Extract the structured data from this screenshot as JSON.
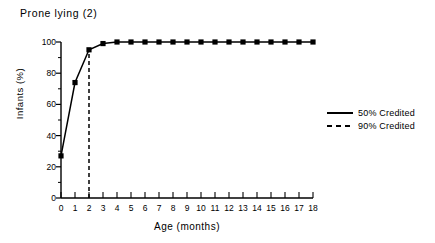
{
  "chart_data": {
    "type": "line",
    "title": "Prone  lying  (2)",
    "xlabel": "Age  (months)",
    "ylabel": "Infants  (%)",
    "xlim": [
      0,
      18
    ],
    "ylim": [
      0,
      100
    ],
    "xticks": [
      0,
      1,
      2,
      3,
      4,
      5,
      6,
      7,
      8,
      9,
      10,
      11,
      12,
      13,
      14,
      15,
      16,
      17,
      18
    ],
    "xtick_labels": [
      "0",
      "1",
      "2",
      "3",
      "4",
      "5",
      "6",
      "7",
      "8",
      "9",
      "10",
      "11",
      "12",
      "13",
      "14",
      "15",
      "16",
      "17",
      "18"
    ],
    "yticks": [
      0,
      20,
      40,
      60,
      80,
      100
    ],
    "ytick_labels": [
      "0",
      "20",
      "40",
      "60",
      "80",
      "100"
    ],
    "yminor_ticks": [
      10,
      30,
      50,
      70,
      90
    ],
    "grid": false,
    "legend_position": "right",
    "x": [
      0,
      1,
      2,
      3,
      4,
      5,
      6,
      7,
      8,
      9,
      10,
      11,
      12,
      13,
      14,
      15,
      16,
      17,
      18
    ],
    "series": [
      {
        "name": "50% Credited",
        "style": "solid",
        "marker": "square",
        "values": [
          27,
          74,
          95,
          99,
          100,
          100,
          100,
          100,
          100,
          100,
          100,
          100,
          100,
          100,
          100,
          100,
          100,
          100,
          100
        ]
      }
    ],
    "annotations": [
      {
        "name": "90% Credited",
        "type": "vertical-line",
        "style": "dashed",
        "x": 2,
        "y_from": 0,
        "y_to": 95
      }
    ],
    "legend": [
      {
        "label": "50% Credited",
        "style": "solid"
      },
      {
        "label": "90% Credited",
        "style": "dashed"
      }
    ],
    "colors": {
      "line": "#000000",
      "axis": "#000000",
      "background": "#ffffff"
    }
  }
}
